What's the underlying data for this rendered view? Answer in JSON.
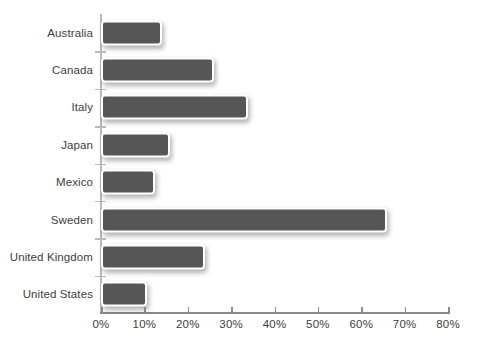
{
  "chart_data": {
    "type": "bar",
    "orientation": "horizontal",
    "title": "",
    "subtitle": "",
    "xlabel": "",
    "ylabel": "",
    "xlim": [
      0,
      80
    ],
    "xunit": "%",
    "grid": false,
    "legend": null,
    "bar_color": "#565656",
    "bar_outline_color": "#ffffff",
    "axis_color": "#8a8a8a",
    "y_axis_color": "#b9b9b9",
    "label_color": "#3d3d3d",
    "background": "#ffffff",
    "categories": [
      "Australia",
      "Canada",
      "Italy",
      "Japan",
      "Mexico",
      "Sweden",
      "United Kingdom",
      "United States"
    ],
    "values": [
      14,
      26,
      34,
      16,
      12.5,
      66,
      24,
      10.5
    ],
    "xticks": [
      0,
      10,
      20,
      30,
      40,
      50,
      60,
      70,
      80
    ],
    "xtick_labels": [
      "0%",
      "10%",
      "20%",
      "30%",
      "40%",
      "50%",
      "60%",
      "70%",
      "80%"
    ]
  }
}
